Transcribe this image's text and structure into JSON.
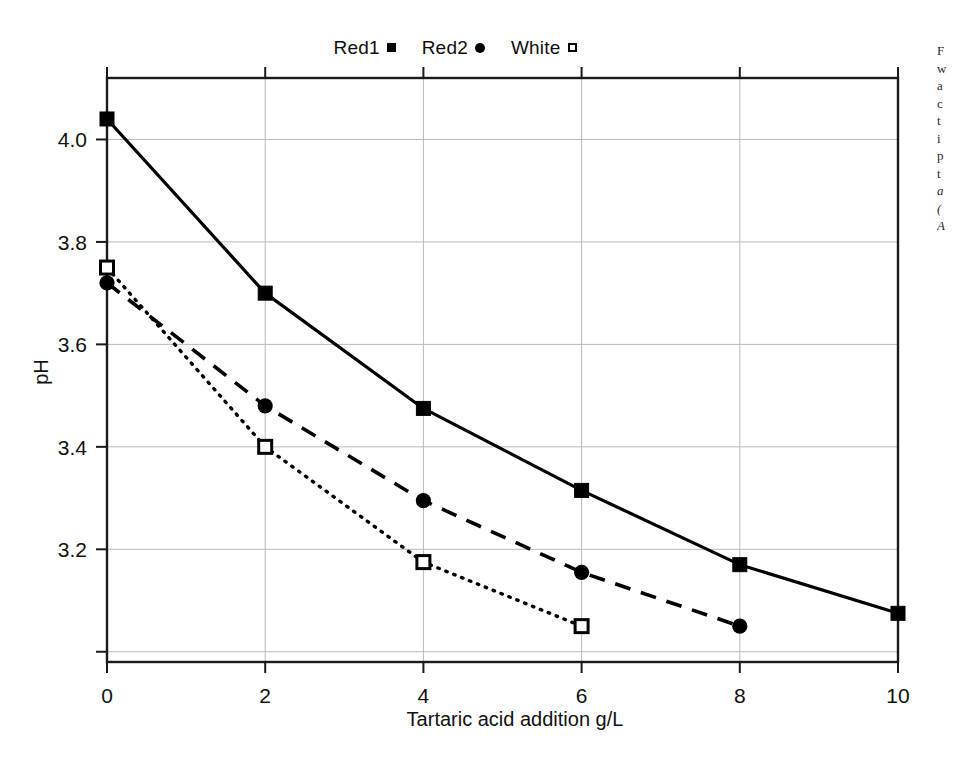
{
  "figure": {
    "background": "#ffffff",
    "ink_color": "#000000",
    "grid_color": "#b9b9b9"
  },
  "legend": {
    "position": "top-center",
    "entries": [
      {
        "label": "Red1",
        "marker": "filled-square",
        "marker_icon": "filled-square-icon"
      },
      {
        "label": "Red2",
        "marker": "filled-circle",
        "marker_icon": "filled-circle-icon"
      },
      {
        "label": "White",
        "marker": "open-square",
        "marker_icon": "open-square-icon"
      }
    ]
  },
  "axes": {
    "x": {
      "title": "Tartaric acid addition g/L",
      "ticks": [
        "0",
        "2",
        "4",
        "6",
        "8",
        "10"
      ],
      "range": [
        0,
        10
      ]
    },
    "y": {
      "title": "pH",
      "ticks": [
        "4.0",
        "3.8",
        "3.6",
        "3.4",
        "3.2"
      ],
      "range": [
        2.98,
        4.12
      ]
    }
  },
  "margin_note": {
    "lines": [
      "F",
      "w",
      "a",
      "c",
      "t",
      "i",
      "p",
      "t",
      "a",
      "(",
      "A"
    ],
    "description": "cut-off caption text at right page edge"
  },
  "chart_data": {
    "type": "line",
    "title": "",
    "subtitle": "",
    "xlabel": "Tartaric acid addition g/L",
    "ylabel": "pH",
    "xlim": [
      0,
      10
    ],
    "ylim": [
      2.98,
      4.12
    ],
    "xticks": [
      0,
      2,
      4,
      6,
      8,
      10
    ],
    "yticks": [
      4.0,
      3.8,
      3.6,
      3.4,
      3.2
    ],
    "grid": true,
    "legend_position": "top-center",
    "series": [
      {
        "name": "Red1",
        "marker": "filled-square",
        "linestyle": "solid",
        "color": "#000000",
        "x": [
          0,
          2,
          4,
          6,
          8,
          10
        ],
        "values": [
          4.04,
          3.7,
          3.475,
          3.315,
          3.17,
          3.075
        ]
      },
      {
        "name": "Red2",
        "marker": "filled-circle",
        "linestyle": "dashed",
        "color": "#000000",
        "x": [
          0,
          2,
          4,
          6,
          8
        ],
        "values": [
          3.72,
          3.48,
          3.295,
          3.155,
          3.05
        ]
      },
      {
        "name": "White",
        "marker": "open-square",
        "linestyle": "dotted",
        "color": "#000000",
        "x": [
          0,
          2,
          4,
          6
        ],
        "values": [
          3.75,
          3.4,
          3.175,
          3.05
        ]
      }
    ]
  }
}
